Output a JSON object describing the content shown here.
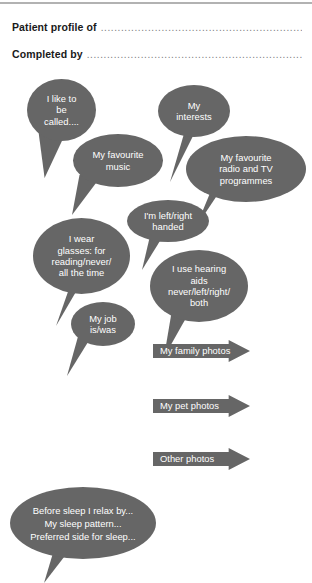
{
  "document": {
    "title": "Patient profile sheet",
    "bubble_color": "#666666",
    "text_color": "#ffffff",
    "rule_color": "#b2b2b2"
  },
  "header": {
    "fields": [
      {
        "label": "Patient profile of",
        "dots": "................................................................................"
      },
      {
        "label": "Completed by",
        "dots": "........................................................................................"
      }
    ]
  },
  "bubbles": [
    {
      "id": "called",
      "text": "I like to\nbe\ncalled...."
    },
    {
      "id": "music",
      "text": "My favourite\nmusic"
    },
    {
      "id": "interests",
      "text": "My\ninterests"
    },
    {
      "id": "radio-tv",
      "text": "My favourite\nradio and TV\nprogrammes"
    },
    {
      "id": "handedness",
      "text": "I'm left/right\nhanded"
    },
    {
      "id": "glasses",
      "text": "I wear\nglasses: for\nreading/never/\nall the time"
    },
    {
      "id": "hearing",
      "text": "I use hearing\naids\nnever/left/right/\nboth"
    },
    {
      "id": "job",
      "text": "My job\nis/was"
    },
    {
      "id": "sleep",
      "text": "Before sleep I relax by...\nMy sleep pattern...\nPreferred side for sleep..."
    }
  ],
  "arrows": [
    {
      "id": "family-photos",
      "label": "My family photos"
    },
    {
      "id": "pet-photos",
      "label": "My pet photos"
    },
    {
      "id": "other-photos",
      "label": "Other photos"
    }
  ]
}
